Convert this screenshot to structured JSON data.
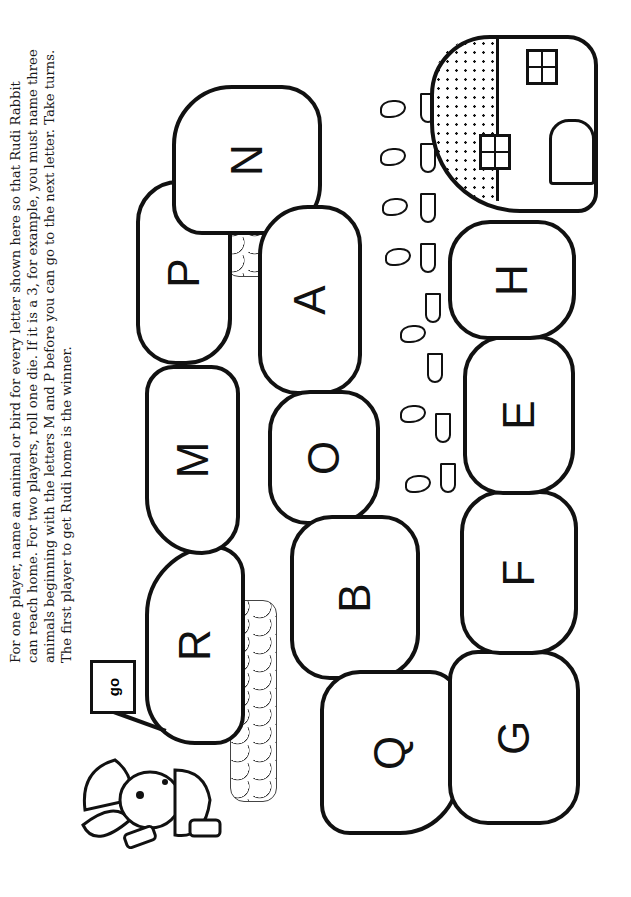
{
  "instructions": {
    "lines": [
      "For one player, name an animal or bird for every letter shown here so that Rudi Rabbit",
      "can reach home. For two players, roll one die. If it is a 3, for example, you must name three",
      "animals beginning with the letters M and P before you can go to the next letter. Take turns.",
      "The first player to get Rudi home is the winner."
    ]
  },
  "flag": {
    "text": "go"
  },
  "path": {
    "stones": [
      {
        "letter": "R"
      },
      {
        "letter": "M"
      },
      {
        "letter": "P"
      },
      {
        "letter": "N"
      },
      {
        "letter": "A"
      },
      {
        "letter": "O"
      },
      {
        "letter": "B"
      },
      {
        "letter": "Q"
      },
      {
        "letter": "G"
      },
      {
        "letter": "F"
      },
      {
        "letter": "E"
      },
      {
        "letter": "H"
      }
    ]
  },
  "characters": {
    "rabbit": "Rudi Rabbit"
  }
}
